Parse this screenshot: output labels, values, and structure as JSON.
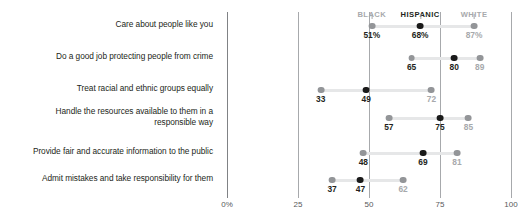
{
  "chart_data": {
    "type": "scatter",
    "title": "",
    "subtitle": "",
    "xlabel": "",
    "ylabel": "",
    "xlim": [
      0,
      100
    ],
    "grid": true,
    "legend_position": "top",
    "xticks": [
      "0%",
      "25",
      "50",
      "75",
      "100"
    ],
    "xtick_values": [
      0,
      25,
      50,
      75,
      100
    ],
    "legend": [
      {
        "name": "BLACK",
        "color": "#939598",
        "style": "light"
      },
      {
        "name": "HISPANIC",
        "color": "#1a1a1a",
        "style": "dark"
      },
      {
        "name": "WHITE",
        "color": "#939598",
        "style": "light"
      }
    ],
    "categories": [
      "Care about people like you",
      "Do a good job protecting people from crime",
      "Treat racial and ethnic groups equally",
      "Handle the resources available to them in a responsible way",
      "Provide fair and accurate information to the public",
      "Admit mistakes and take responsibility for them"
    ],
    "series": [
      {
        "name": "BLACK",
        "values": [
          51,
          65,
          33,
          57,
          48,
          37
        ]
      },
      {
        "name": "HISPANIC",
        "values": [
          68,
          80,
          49,
          75,
          69,
          47
        ]
      },
      {
        "name": "WHITE",
        "values": [
          87,
          89,
          72,
          85,
          81,
          62
        ]
      }
    ],
    "rows": [
      {
        "label": "Care about people like you",
        "points": [
          {
            "group": "BLACK",
            "value": 51,
            "display": "51%",
            "emphasis": "dark"
          },
          {
            "group": "HISPANIC",
            "value": 68,
            "display": "68%",
            "emphasis": "dark"
          },
          {
            "group": "WHITE",
            "value": 87,
            "display": "87%",
            "emphasis": "muted"
          }
        ]
      },
      {
        "label": "Do a good job protecting people from crime",
        "points": [
          {
            "group": "BLACK",
            "value": 65,
            "display": "65",
            "emphasis": "dark"
          },
          {
            "group": "HISPANIC",
            "value": 80,
            "display": "80",
            "emphasis": "dark"
          },
          {
            "group": "WHITE",
            "value": 89,
            "display": "89",
            "emphasis": "muted"
          }
        ]
      },
      {
        "label": "Treat racial and ethnic groups equally",
        "points": [
          {
            "group": "BLACK",
            "value": 33,
            "display": "33",
            "emphasis": "dark"
          },
          {
            "group": "HISPANIC",
            "value": 49,
            "display": "49",
            "emphasis": "dark"
          },
          {
            "group": "WHITE",
            "value": 72,
            "display": "72",
            "emphasis": "muted"
          }
        ]
      },
      {
        "label": "Handle the resources available to them in a responsible way",
        "points": [
          {
            "group": "BLACK",
            "value": 57,
            "display": "57",
            "emphasis": "dark"
          },
          {
            "group": "HISPANIC",
            "value": 75,
            "display": "75",
            "emphasis": "dark"
          },
          {
            "group": "WHITE",
            "value": 85,
            "display": "85",
            "emphasis": "muted"
          }
        ]
      },
      {
        "label": "Provide fair and accurate information to the public",
        "points": [
          {
            "group": "BLACK",
            "value": 48,
            "display": "48",
            "emphasis": "dark"
          },
          {
            "group": "HISPANIC",
            "value": 69,
            "display": "69",
            "emphasis": "dark"
          },
          {
            "group": "WHITE",
            "value": 81,
            "display": "81",
            "emphasis": "muted"
          }
        ]
      },
      {
        "label": "Admit mistakes and take responsibility for them",
        "points": [
          {
            "group": "BLACK",
            "value": 37,
            "display": "37",
            "emphasis": "dark"
          },
          {
            "group": "HISPANIC",
            "value": 47,
            "display": "47",
            "emphasis": "dark"
          },
          {
            "group": "WHITE",
            "value": 62,
            "display": "62",
            "emphasis": "muted"
          }
        ]
      }
    ]
  },
  "row_labels_display": [
    "Care about people like you",
    "Do a good job protecting people from crime",
    "Treat racial and ethnic groups equally",
    "Handle the resources available to them in a<br>responsible way",
    "Provide fair and accurate information to the public",
    "Admit mistakes and take responsibility for them"
  ]
}
